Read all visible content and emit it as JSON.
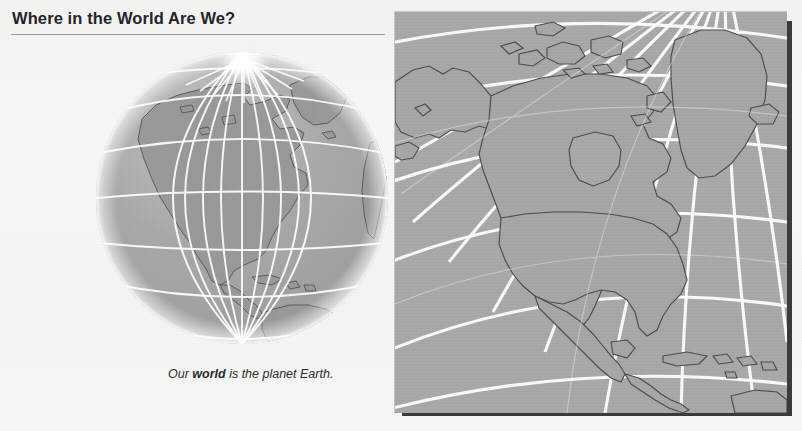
{
  "page": {
    "background_color": "#f5f5f3",
    "title": "Where in the World Are We?",
    "title_color": "#23252b",
    "rule_color": "#9b9b9b"
  },
  "globe": {
    "name": "world-globe-illustration",
    "alt": "Globe showing the Americas with latitude and longitude grid",
    "ocean_color": "#a9a9a9",
    "land_color": "#9a9a9a",
    "coast_color": "#5b5b5b",
    "grid_color": "#ffffff",
    "highlight": "north-pole-light-burst",
    "continents": [
      "North America",
      "South America",
      "Greenland",
      "Africa"
    ]
  },
  "caption": {
    "prefix": "Our ",
    "emphasis": "world",
    "suffix": " is the planet Earth."
  },
  "map": {
    "name": "north-america-polar-map",
    "alt": "Polar projection map of North America with graticule",
    "background_color": "#a9a9a9",
    "land_color": "#a7a7a7",
    "coast_color": "#4f4f4f",
    "grid_color": "#ffffff",
    "shadow_color": "#3b3b3d",
    "regions": [
      "Alaska",
      "Canada",
      "Greenland",
      "United States",
      "Mexico",
      "Central America",
      "Caribbean",
      "Iceland",
      "Hudson Bay",
      "Great Lakes"
    ]
  }
}
